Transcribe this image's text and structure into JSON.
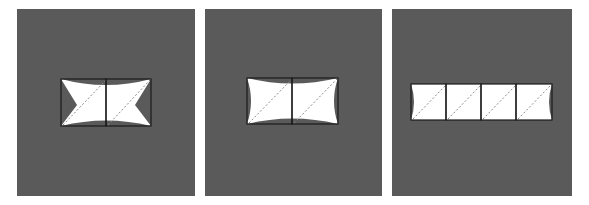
{
  "figure": {
    "panel_count": 3,
    "colors": {
      "background": "#ffffff",
      "panel_fill": "#5a5a5a",
      "shape_fill": "#ffffff",
      "outline": "#1a1a1a",
      "diagonal_dash": "#8a8a8a"
    },
    "panels": [
      {
        "id": "panel-1",
        "description": "Two squares joined side by side; white bow-tie shape with deep concave notches on left and right edges and shallow curved top and bottom edges; dashed diagonal in each square",
        "cells": 2,
        "notch": "deep-pointed"
      },
      {
        "id": "panel-2",
        "description": "Two squares joined side by side; white shape with shallow concave curved edges on all four sides; dashed diagonal in each square",
        "cells": 2,
        "notch": "shallow-curved"
      },
      {
        "id": "panel-3",
        "description": "Four squares joined in a row; white strip with slightly concave left and right ends; dashed diagonal in each square",
        "cells": 4,
        "notch": "slight-end-curve"
      }
    ]
  }
}
